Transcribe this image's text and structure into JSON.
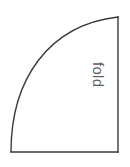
{
  "figure": {
    "name": "quarter-circle-fold-template",
    "background_color": "#ffffff",
    "line_color": "#3a3a3a",
    "line_width": 1.4
  },
  "shape": {
    "type": "quarter-circle",
    "corner": {
      "x": 11,
      "y": 152
    },
    "bottom_edge": {
      "x1": 11,
      "y1": 152,
      "x2": 118,
      "y2": 152
    },
    "right_edge": {
      "x1": 118,
      "y1": 152,
      "x2": 118,
      "y2": 17
    },
    "arc": {
      "start": {
        "x": 11,
        "y": 152
      },
      "end": {
        "x": 118,
        "y": 17
      },
      "radius_x": 107,
      "radius_y": 135,
      "sweep": "convex-up-right"
    }
  },
  "labels": {
    "fold": {
      "text": "fold",
      "rotation_deg": 90,
      "color": "#5f5f5f",
      "x": 104,
      "y": 62
    }
  }
}
